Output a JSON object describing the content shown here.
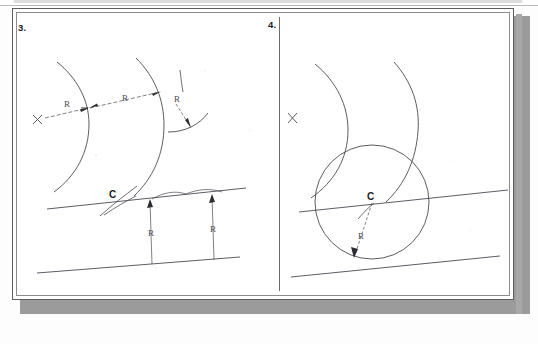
{
  "document": {
    "type": "scanned-worksheet",
    "background_color": "#fdfdfd",
    "paper_color": "#ffffff",
    "ink_color": "#4a4a52",
    "border_color": "#5d5d5d",
    "shadow_color": "#9b9b9b"
  },
  "panels": [
    {
      "id": "panel-3",
      "number": "3.",
      "side": "left",
      "description": "Construction step 3: arcs offset by R from two given lines and from an existing arc",
      "labels": [
        {
          "id": "r-left",
          "text": "R",
          "x": 68,
          "y": 104
        },
        {
          "id": "r-mid",
          "text": "R",
          "x": 126,
          "y": 98
        },
        {
          "id": "r-arc",
          "text": "R",
          "x": 178,
          "y": 99
        },
        {
          "id": "c-point",
          "text": "C",
          "x": 113,
          "y": 194,
          "bold": true
        },
        {
          "id": "r-dim-1",
          "text": "R",
          "x": 152,
          "y": 232
        },
        {
          "id": "r-dim-2",
          "text": "R",
          "x": 214,
          "y": 228
        }
      ],
      "markers": [
        {
          "id": "x-center-mark",
          "text": "X",
          "x": 37,
          "y": 120
        }
      ]
    },
    {
      "id": "panel-4",
      "number": "4.",
      "side": "right",
      "description": "Construction step 4: resulting tangent circle of radius R centered at C",
      "labels": [
        {
          "id": "c-center",
          "text": "C",
          "x": 372,
          "y": 196,
          "bold": true
        },
        {
          "id": "r-radius",
          "text": "R",
          "x": 362,
          "y": 235
        }
      ],
      "markers": [
        {
          "id": "x-center-mark",
          "text": "X",
          "x": 292,
          "y": 118
        }
      ]
    }
  ],
  "page_header": {
    "visible_text": "",
    "note": "top line of page is cropped out of frame"
  }
}
